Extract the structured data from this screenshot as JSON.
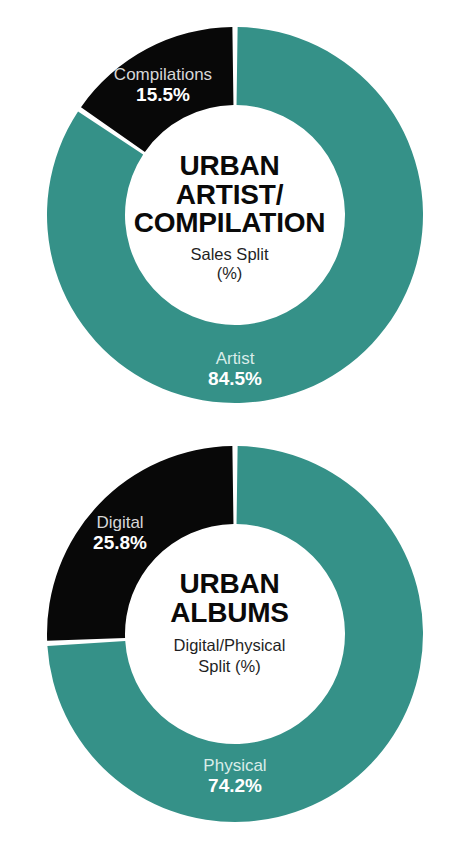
{
  "colors": {
    "teal": "#359188",
    "black": "#080808",
    "white": "#ffffff",
    "label_light": "#d7d7d7",
    "label_teal_light": "#d9ece9",
    "center_title": "#0a0a0a",
    "center_sub": "#1f1f1f"
  },
  "charts": [
    {
      "id": "urban-artist-compilation",
      "center_title_lines": [
        "URBAN",
        "ARTIST/",
        "COMPILATION"
      ],
      "center_sub_lines": [
        "Sales Split",
        "(%)"
      ],
      "slices": [
        {
          "label": "Artist",
          "value_label": "84.5%",
          "value": 84.5,
          "color": "#359188"
        },
        {
          "label": "Compilations",
          "value_label": "15.5%",
          "value": 15.5,
          "color": "#080808"
        }
      ]
    },
    {
      "id": "urban-albums",
      "center_title_lines": [
        "URBAN",
        "ALBUMS"
      ],
      "center_sub_lines": [
        "Digital/Physical",
        "Split (%)"
      ],
      "slices": [
        {
          "label": "Physical",
          "value_label": "74.2%",
          "value": 74.2,
          "color": "#359188"
        },
        {
          "label": "Digital",
          "value_label": "25.8%",
          "value": 25.8,
          "color": "#080808"
        }
      ]
    }
  ],
  "chart_data": [
    {
      "type": "pie",
      "title": "URBAN ARTIST/COMPILATION",
      "subtitle": "Sales Split (%)",
      "categories": [
        "Artist",
        "Compilations"
      ],
      "values": [
        84.5,
        15.5
      ],
      "value_labels": [
        "84.5%",
        "15.5%"
      ],
      "colors": [
        "#359188",
        "#080808"
      ],
      "donut": true,
      "inner_radius_ratio": 0.585,
      "start_angle_deg": 0,
      "direction": "clockwise",
      "legend": "none",
      "grid": false,
      "xlabel": "",
      "ylabel": ""
    },
    {
      "type": "pie",
      "title": "URBAN ALBUMS",
      "subtitle": "Digital/Physical Split (%)",
      "categories": [
        "Physical",
        "Digital"
      ],
      "values": [
        74.2,
        25.8
      ],
      "value_labels": [
        "74.2%",
        "25.8%"
      ],
      "colors": [
        "#359188",
        "#080808"
      ],
      "donut": true,
      "inner_radius_ratio": 0.585,
      "start_angle_deg": 0,
      "direction": "clockwise",
      "legend": "none",
      "grid": false,
      "xlabel": "",
      "ylabel": ""
    }
  ]
}
